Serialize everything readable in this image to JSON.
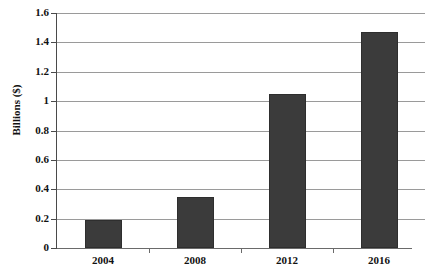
{
  "chart_data": {
    "type": "bar",
    "title": "",
    "subtitle": "",
    "xlabel": "",
    "ylabel": "Billions ($)",
    "categories": [
      "2004",
      "2008",
      "2012",
      "2016"
    ],
    "values": [
      0.19,
      0.35,
      1.05,
      1.47
    ],
    "series": [
      {
        "name": "",
        "values": [
          0.19,
          0.35,
          1.05,
          1.47
        ]
      }
    ],
    "ylim": [
      0,
      1.6
    ],
    "ytick_labels": [
      "0",
      "0.2",
      "0.4",
      "0.6",
      "0.8",
      "1",
      "1.2",
      "1.4",
      "1.6"
    ],
    "ytick_values": [
      0,
      0.2,
      0.4,
      0.6,
      0.8,
      1,
      1.2,
      1.4,
      1.6
    ],
    "grid": true,
    "grid_axis": "y",
    "legend": false,
    "legend_position": "none",
    "annotations": [],
    "colors": {
      "bar_fill": "#3b3b3b",
      "bar_border": "#2e2e2e",
      "gridline": "#9a9a9a",
      "axis": "#4a4a4a",
      "text": "#111111",
      "background": "#ffffff"
    }
  }
}
